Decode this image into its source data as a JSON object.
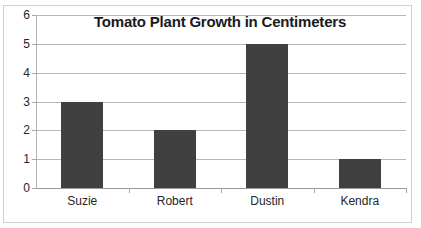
{
  "top_sliver_text": "",
  "chart_data": {
    "type": "bar",
    "title": "Tomato Plant Growth in Centimeters",
    "xlabel": "",
    "ylabel": "",
    "categories": [
      "Suzie",
      "Robert",
      "Dustin",
      "Kendra"
    ],
    "values": [
      3,
      2,
      5,
      1
    ],
    "ylim": [
      0,
      6
    ],
    "y_ticks": [
      0,
      1,
      2,
      3,
      4,
      5,
      6
    ],
    "y_tick_labels": [
      "0",
      "1",
      "2",
      "3",
      "4",
      "5",
      "6"
    ],
    "grid": true,
    "legend": false,
    "bar_color": "#404040",
    "gridline_color": "#b8b8b8",
    "frame_color": "#d0d0d0",
    "title_color": "#1a1a1a",
    "label_color": "#262626"
  }
}
